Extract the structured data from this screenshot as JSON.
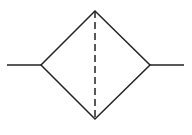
{
  "diagram": {
    "type": "pneumatic-filter-symbol",
    "stroke_color": "#222222",
    "background": "#ffffff",
    "elements": {
      "input_line": {
        "x1": 7,
        "y1": 65,
        "x2": 41,
        "y2": 65
      },
      "diamond": {
        "left": [
          41,
          65
        ],
        "top": [
          95,
          11
        ],
        "right": [
          150,
          65
        ],
        "bottom": [
          95,
          119
        ]
      },
      "dashed_line": {
        "x1": 95,
        "y1": 11,
        "x2": 95,
        "y2": 119
      },
      "output_line": {
        "x1": 150,
        "y1": 65,
        "x2": 184,
        "y2": 65
      }
    }
  }
}
